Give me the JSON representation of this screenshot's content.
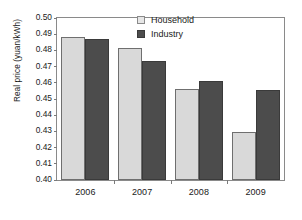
{
  "chart_data": {
    "type": "bar",
    "title": "",
    "xlabel": "",
    "ylabel": "Real price (yuan/kWh)",
    "categories": [
      "2006",
      "2007",
      "2008",
      "2009"
    ],
    "series": [
      {
        "name": "Household",
        "color": "#d9d9d9",
        "values": [
          0.4882,
          0.4812,
          0.456,
          0.4294
        ]
      },
      {
        "name": "Industry",
        "color": "#4c4c4c",
        "values": [
          0.4873,
          0.4735,
          0.4612,
          0.4554
        ]
      }
    ],
    "ylim": [
      0.4,
      0.5
    ],
    "ytick_values": [
      0.4,
      0.41,
      0.42,
      0.43,
      0.44,
      0.45,
      0.46,
      0.47,
      0.48,
      0.49,
      0.5
    ],
    "ytick_labels": [
      "0.40",
      "0.41",
      "0.42",
      "0.43",
      "0.44",
      "0.45",
      "0.46",
      "0.47",
      "0.48",
      "0.49",
      "0.50"
    ],
    "grid": false,
    "legend_position": "top-right",
    "frame": true
  },
  "legend": {
    "items": [
      {
        "label": "Household",
        "swatch": "household"
      },
      {
        "label": "Industry",
        "swatch": "industry"
      }
    ]
  }
}
